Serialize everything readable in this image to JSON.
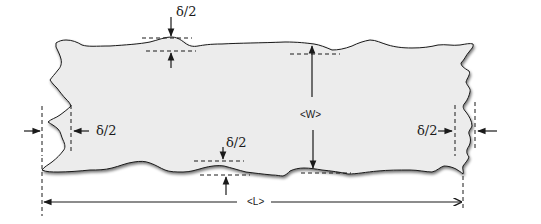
{
  "figure": {
    "colors": {
      "fill": "#ececec",
      "outline": "#1a1a1a",
      "lines": "#1a1a1a",
      "background": "#ffffff"
    }
  },
  "labels": {
    "top_delta": "δ/2",
    "bottom_delta": "δ/2",
    "left_delta": "δ/2",
    "right_delta": "δ/2",
    "width": "<W>",
    "length": "<L>"
  }
}
